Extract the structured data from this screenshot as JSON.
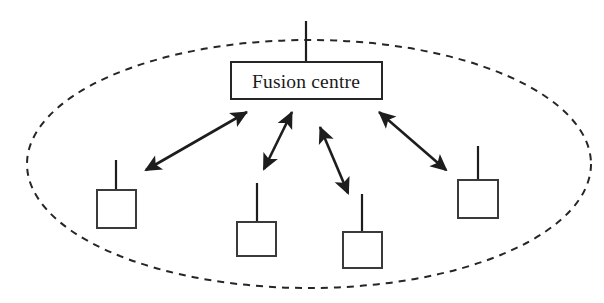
{
  "figure": {
    "background_color": "#ffffff",
    "stroke_color": "#262626",
    "width": 604,
    "height": 303
  },
  "boundary": {
    "shape_name": "network-boundary-ellipse",
    "style": "dashed",
    "cx": 309,
    "cy": 164,
    "rx": 282,
    "ry": 124,
    "dash": "7 6",
    "stroke_width": 2,
    "color": "#262626"
  },
  "fusion_centre": {
    "label": "Fusion centre",
    "x": 231,
    "y": 62,
    "width": 151,
    "height": 37,
    "text_x": 306,
    "text_y": 88,
    "antenna": {
      "x": 306,
      "y_top": 21,
      "y_bottom": 62
    }
  },
  "nodes": [
    {
      "name": "sensor-node-1",
      "label": "",
      "x": 97,
      "y": 190,
      "width": 39,
      "height": 38,
      "antenna": {
        "x": 116,
        "y_top": 160,
        "y_bottom": 190
      }
    },
    {
      "name": "sensor-node-2",
      "label": "",
      "x": 237,
      "y": 222,
      "width": 39,
      "height": 34,
      "antenna": {
        "x": 257,
        "y_top": 183,
        "y_bottom": 222
      }
    },
    {
      "name": "sensor-node-3",
      "label": "",
      "x": 343,
      "y": 232,
      "width": 39,
      "height": 36,
      "antenna": {
        "x": 362,
        "y_top": 194,
        "y_bottom": 232
      }
    },
    {
      "name": "sensor-node-4",
      "label": "",
      "x": 458,
      "y": 180,
      "width": 40,
      "height": 38,
      "antenna": {
        "x": 478,
        "y_top": 146,
        "y_bottom": 180
      }
    }
  ],
  "links": [
    {
      "name": "link-fusion-node-1",
      "style": "double-headed-arrow",
      "x1": 146,
      "y1": 170,
      "x2": 247,
      "y2": 112
    },
    {
      "name": "link-fusion-node-2",
      "style": "double-headed-arrow",
      "x1": 264,
      "y1": 169,
      "x2": 292,
      "y2": 112
    },
    {
      "name": "link-fusion-node-3",
      "style": "double-headed-arrow",
      "x1": 348,
      "y1": 193,
      "x2": 320,
      "y2": 127
    },
    {
      "name": "link-fusion-node-4",
      "style": "double-headed-arrow",
      "x1": 446,
      "y1": 170,
      "x2": 379,
      "y2": 112
    }
  ]
}
